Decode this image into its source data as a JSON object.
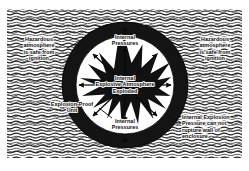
{
  "figure": {
    "colors": {
      "ink": "#0b0b0b",
      "enclosure_wall": "#1a1a1a",
      "interior": "#ffffff",
      "paper": "#ffffff",
      "hatch": "#2b2b2b"
    },
    "background": {
      "pattern_name": "wavy-hatch-texture",
      "meaning": "hazardous atmosphere surrounding the enclosure"
    }
  },
  "labels": {
    "left": {
      "name": "hazardous-atmosphere-left",
      "lines": [
        "Hazardous",
        "atmosphere",
        "is safe from",
        "ignition"
      ]
    },
    "right": {
      "name": "hazardous-atmosphere-right",
      "lines": [
        "Hazardous",
        "atmosphere",
        "is safe from",
        "ignition"
      ]
    },
    "top": {
      "name": "internal-pressures-top",
      "lines": [
        "Internal",
        "Pressures"
      ]
    },
    "bottom": {
      "name": "internal-pressures-bottom",
      "lines": [
        "Internal",
        "Pressures"
      ]
    },
    "center": {
      "name": "internal-explosive-atmosphere",
      "lines": [
        "Internal",
        "Explosive Atmosphere",
        "Exploded"
      ]
    },
    "unit": {
      "name": "explosion-proof-unit",
      "lines": [
        "Explosion-Proof",
        "Unit"
      ]
    },
    "note": {
      "name": "containment-note",
      "lines": [
        "Internal Explosion",
        "Pressure can not",
        "rupture wall of",
        "enclosure"
      ]
    }
  },
  "graphics": {
    "enclosure": {
      "name": "explosion-proof-enclosure-ring",
      "center_x": 125,
      "center_y": 85,
      "outer_radius": 63,
      "inner_radius": 49
    },
    "starburst": {
      "name": "internal-explosion-starburst",
      "points": 16,
      "outer_radius": 46,
      "inner_radius": 17
    },
    "arrows": [
      {
        "name": "pressure-arrow-up",
        "direction": "up"
      },
      {
        "name": "pressure-arrow-down",
        "direction": "down"
      },
      {
        "name": "pressure-arrow-left",
        "direction": "left"
      },
      {
        "name": "pressure-arrow-right",
        "direction": "right"
      },
      {
        "name": "pressure-arrow-diagonal-ne",
        "direction": "north-east"
      },
      {
        "name": "pressure-arrow-diagonal-nw",
        "direction": "north-west"
      },
      {
        "name": "pressure-arrow-diagonal-se",
        "direction": "south-east"
      },
      {
        "name": "pressure-arrow-diagonal-sw",
        "direction": "south-west"
      }
    ]
  }
}
